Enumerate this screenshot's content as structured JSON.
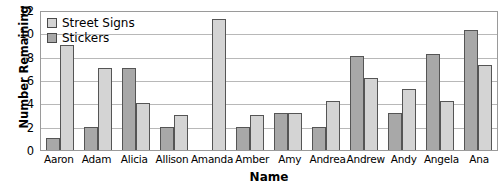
{
  "chart_data": {
    "type": "bar",
    "title": "",
    "xlabel": "Name",
    "ylabel": "Number Remaining",
    "categories": [
      "Aaron",
      "Adam",
      "Alicia",
      "Allison",
      "Amanda",
      "Amber",
      "Amy",
      "Andrea",
      "Andrew",
      "Andy",
      "Angela",
      "Ana"
    ],
    "series": [
      {
        "name": "Stickers",
        "color": "#a8a8a8",
        "values": [
          1,
          2,
          7,
          2,
          0,
          2,
          3.2,
          2,
          8.1,
          3.2,
          8.2,
          10.3
        ]
      },
      {
        "name": "Street Signs",
        "color": "#d4d4d4",
        "values": [
          9,
          7,
          4,
          3,
          11.2,
          3,
          3.2,
          4.2,
          6.2,
          5.2,
          4.2,
          7.3
        ]
      }
    ],
    "ylim": [
      0,
      12
    ],
    "yticks": [
      0,
      2,
      4,
      6,
      8,
      10,
      12
    ],
    "ytick_labels": [
      "0",
      "2",
      "4",
      "6",
      "8",
      "10",
      "12"
    ],
    "grid": true,
    "grid_axis": "y",
    "legend": [
      "Street Signs",
      "Stickers"
    ],
    "legend_position": "top-left-inside",
    "bar_order_in_group": [
      "Stickers",
      "Street Signs"
    ]
  },
  "legend": {
    "items": [
      {
        "label": "Street Signs",
        "swatch": "signs"
      },
      {
        "label": "Stickers",
        "swatch": "stick"
      }
    ]
  }
}
